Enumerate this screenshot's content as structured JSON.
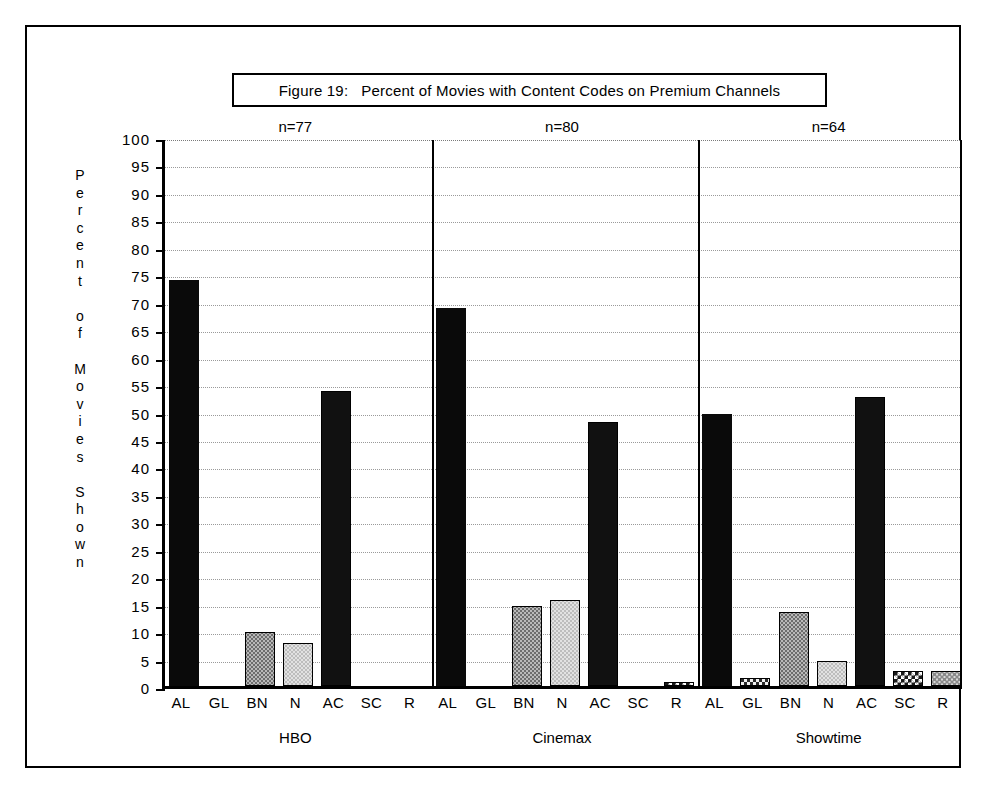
{
  "figure": {
    "title": "Figure 19:   Percent of Movies with Content Codes on Premium Channels",
    "y_axis_title_stacked": "P\ne\nr\nc\ne\nn\nt\n\no\nf\n\nM\no\nv\ni\ne\ns\n\nS\nh\no\nw\nn"
  },
  "chart_data": {
    "type": "bar",
    "title": "Figure 19:   Percent of Movies with Content Codes on Premium Channels",
    "xlabel": "",
    "ylabel": "Percent of Movies Shown",
    "ylim": [
      0,
      100
    ],
    "ytick_step": 5,
    "ytick_labels": [
      "100",
      "95",
      "90",
      "85",
      "80",
      "75",
      "70",
      "65",
      "60",
      "55",
      "50",
      "45",
      "40",
      "35",
      "30",
      "25",
      "20",
      "15",
      "10",
      "5",
      "0"
    ],
    "grid": true,
    "legend": "none",
    "categories": [
      "AL",
      "GL",
      "BN",
      "N",
      "AC",
      "SC",
      "R"
    ],
    "category_full_names": {
      "AL": "AL",
      "GL": "GL",
      "BN": "BN",
      "N": "N",
      "AC": "AC",
      "SC": "SC",
      "R": "R"
    },
    "groups": [
      {
        "name": "HBO",
        "annotation": "n=77",
        "values": [
          74.0,
          0,
          9.9,
          7.8,
          53.8,
          0,
          0
        ],
        "fills": [
          "black",
          "none",
          "gray",
          "lightgray",
          "dark",
          "none",
          "none"
        ]
      },
      {
        "name": "Cinemax",
        "annotation": "n=80",
        "values": [
          68.8,
          0,
          14.6,
          15.6,
          48.0,
          0,
          0.8
        ],
        "fills": [
          "black",
          "none",
          "gray",
          "lightgray",
          "dark",
          "none",
          "checker-mid"
        ]
      },
      {
        "name": "Showtime",
        "annotation": "n=64",
        "values": [
          49.6,
          1.5,
          13.5,
          4.5,
          52.7,
          2.8,
          2.7
        ],
        "fills": [
          "black",
          "checker-dark",
          "gray",
          "lightgray",
          "dark",
          "checker-mid",
          "dot-light"
        ]
      }
    ]
  }
}
